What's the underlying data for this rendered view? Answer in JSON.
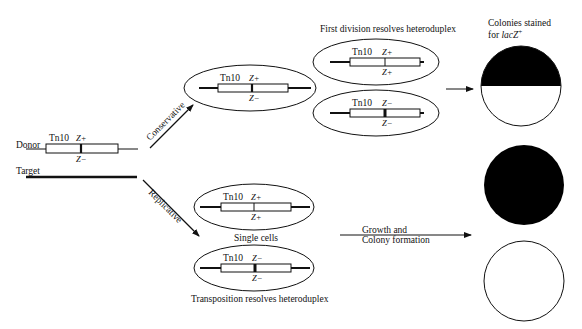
{
  "donor": {
    "label": "Donor",
    "element": "Tn10",
    "top_allele": "Z+",
    "bottom_allele": "Z−"
  },
  "target": {
    "label": "Target"
  },
  "pathways": {
    "conservative": {
      "label": "Conservative"
    },
    "replicative": {
      "label": "Replicative"
    }
  },
  "conservative_product": {
    "element": "Tn10",
    "top_allele": "Z+",
    "bottom_allele": "Z−"
  },
  "first_division": {
    "heading": "First division resolves heteroduplex",
    "cells": [
      {
        "element": "Tn10",
        "top_allele": "Z+",
        "bottom_allele": "Z+"
      },
      {
        "element": "Tn10",
        "top_allele": "Z−",
        "bottom_allele": "Z−"
      }
    ]
  },
  "replicative_products": {
    "cells": [
      {
        "element": "Tn10",
        "top_allele": "Z+",
        "bottom_allele": "Z+"
      },
      {
        "element": "Tn10",
        "top_allele": "Z−",
        "bottom_allele": "Z−"
      }
    ],
    "middle_caption": "Single cells",
    "bottom_caption": "Transposition resolves heteroduplex"
  },
  "growth": {
    "line1": "Growth and",
    "line2": "Colony formation"
  },
  "colonies": {
    "heading_line1": "Colonies stained",
    "heading_line2_prefix": "for ",
    "heading_line2_gene": "lacZ",
    "heading_line2_sup": "+",
    "items": [
      {
        "state": "sectored",
        "top_color": "#000000",
        "bottom_color": "#ffffff"
      },
      {
        "state": "all-blue",
        "color": "#000000"
      },
      {
        "state": "all-white",
        "color": "#ffffff"
      }
    ]
  }
}
